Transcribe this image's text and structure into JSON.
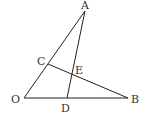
{
  "diagram": {
    "type": "geometry",
    "points": {
      "A": {
        "x": 85,
        "y": 11,
        "label": "A",
        "lx": 81,
        "ly": 9
      },
      "O": {
        "x": 24,
        "y": 98,
        "label": "O",
        "lx": 11,
        "ly": 103
      },
      "B": {
        "x": 128,
        "y": 98,
        "label": "B",
        "lx": 131,
        "ly": 103
      },
      "C": {
        "x": 48,
        "y": 64,
        "label": "C",
        "lx": 37,
        "ly": 65
      },
      "D": {
        "x": 67,
        "y": 98,
        "label": "D",
        "lx": 61,
        "ly": 112
      },
      "E": {
        "x": 71,
        "y": 73,
        "label": "E",
        "lx": 75,
        "ly": 74
      }
    },
    "segments": [
      [
        "O",
        "A"
      ],
      [
        "A",
        "D"
      ],
      [
        "O",
        "B"
      ],
      [
        "C",
        "B"
      ]
    ],
    "colors": {
      "line": "#222222",
      "label": "#333333"
    }
  }
}
